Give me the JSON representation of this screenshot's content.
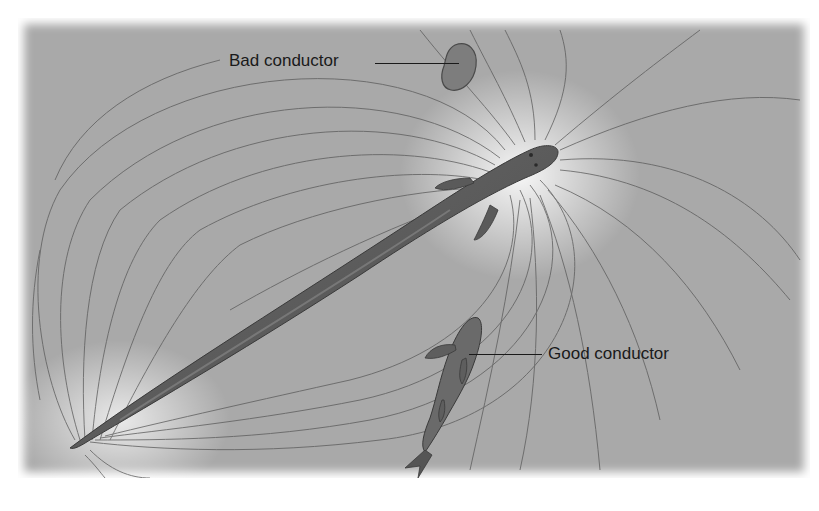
{
  "figure": {
    "background_color": "#a9a9a9",
    "field_line_color": "#555555",
    "labels": [
      {
        "id": "bad",
        "text": "Bad conductor"
      },
      {
        "id": "good",
        "text": "Good conductor"
      }
    ],
    "objects": [
      {
        "name": "electric-eel",
        "color": "#5a5a5a"
      },
      {
        "name": "rock",
        "role": "bad conductor",
        "color": "#7a7a7a"
      },
      {
        "name": "small-fish",
        "role": "good conductor",
        "color": "#666666"
      }
    ]
  }
}
